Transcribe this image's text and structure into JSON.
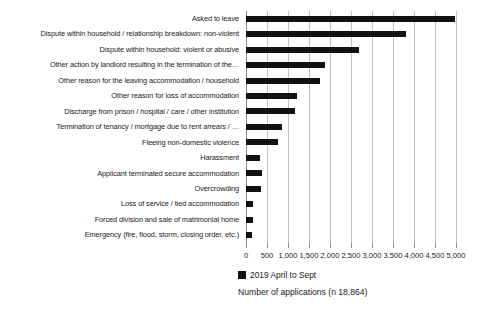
{
  "chart_data": {
    "type": "bar",
    "orientation": "horizontal",
    "title": "",
    "xlabel": "Number of applications (n 18,864)",
    "ylabel": "",
    "xlim": [
      0,
      5000
    ],
    "xticks": [
      "0",
      "500",
      "1,000",
      "1,500",
      "2,000",
      "2,500",
      "3,000",
      "3,500",
      "4,000",
      "4,500",
      "5,000"
    ],
    "xtick_values": [
      0,
      500,
      1000,
      1500,
      2000,
      2500,
      3000,
      3500,
      4000,
      4500,
      5000
    ],
    "grid": true,
    "grid_axis": "x",
    "legend_position": "bottom",
    "bar_color": "#111111",
    "grid_color": "#bfbfbf",
    "series": [
      {
        "name": "2019 April to Sept",
        "values": [
          4980,
          3810,
          2690,
          1880,
          1760,
          1215,
          1170,
          860,
          760,
          340,
          390,
          360,
          175,
          165,
          140
        ]
      }
    ],
    "categories": [
      "Asked to leave",
      "Dispute within household / relationship breakdown: non-violent",
      "Dispute within household: violent or abusive",
      "Other action by landlord resulting in the termination of the…",
      "Other reason for the leaving accommodation / household",
      "Other reason for loss of accommodation",
      "Discharge from prison / hospital / care / other institution",
      "Termination of tenancy / mortgage due to rent arrears / …",
      "Fleeing non-domestic violence",
      "Harassment",
      "Applicant terminated secure accommodation",
      "Overcrowding",
      "Loss of service / tied accommodation",
      "Forced division and sale of matrimonial home",
      "Emergency (fire, flood, storm, closing order, etc.)"
    ]
  },
  "legend": {
    "entries": [
      {
        "label": "2019 April to Sept",
        "color": "#111111"
      }
    ]
  },
  "axis_title": "Number of applications (n 18,864)"
}
